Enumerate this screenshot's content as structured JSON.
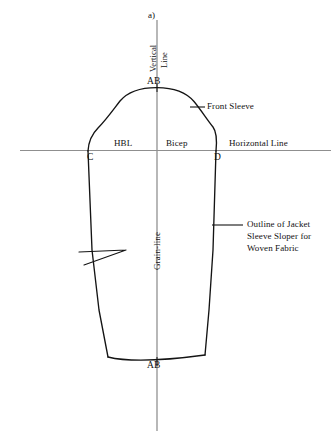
{
  "figure": {
    "panel_label": "a)",
    "caption_absent": true
  },
  "axes": {
    "vertical_line_label": "Vertical\nLine",
    "vertical_line_label_line1": "Vertical",
    "vertical_line_label_line2": "Line",
    "horizontal_line_label": "Horizontal Line",
    "grain_line_label": "Grain-line"
  },
  "points": {
    "cap_top": "AB",
    "hem_center": "AB",
    "left_underarm": "C",
    "right_underarm": "D"
  },
  "measures": {
    "left_half": "HBL",
    "right_half": "Bicep"
  },
  "annotations": {
    "front_sleeve": "Front Sleeve",
    "outline_line1": "Outline of Jacket",
    "outline_line2": "Sleeve Sloper for",
    "outline_line3": "Woven Fabric"
  },
  "colors": {
    "outline": "#111111",
    "construction_line": "#9a9a9a",
    "background": "#ffffff",
    "text": "#111111"
  },
  "geometry": {
    "vertical_line_x": 157,
    "vertical_line_y_top": 20,
    "vertical_line_y_bottom": 431,
    "horizontal_line_y": 150,
    "horizontal_line_x_left": 20,
    "horizontal_line_x_right": 331,
    "cap_apex": [
      157,
      88
    ],
    "point_c": [
      88,
      151
    ],
    "point_d": [
      216,
      151
    ],
    "hem_left": [
      108,
      357
    ],
    "hem_right": [
      205,
      355
    ],
    "hem_center_dip": [
      157,
      362
    ]
  }
}
